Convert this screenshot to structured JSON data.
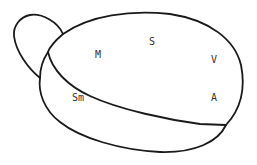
{
  "diagram": {
    "type": "outline-figure",
    "stroke_color": "#1a1a1a",
    "labels": [
      {
        "text": "M",
        "x": 99,
        "y": 55
      },
      {
        "text": "S",
        "x": 153,
        "y": 43
      },
      {
        "text": "V",
        "x": 215,
        "y": 61
      },
      {
        "text": "Sm",
        "x": 78,
        "y": 99
      },
      {
        "text": "A",
        "x": 215,
        "y": 99
      }
    ]
  }
}
